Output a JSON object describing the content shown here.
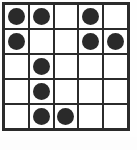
{
  "board": {
    "title": "5x5 dot grid",
    "rows": 5,
    "columns": 5,
    "cell_filled_label": "filled",
    "cell_empty_label": "empty",
    "colors": {
      "background": "#ffffff",
      "grid_line": "#2b2b2b",
      "cell": "#ffffff",
      "disc": "#2a2a2a"
    },
    "total_discs": 10,
    "cells": [
      [
        1,
        1,
        0,
        1,
        0
      ],
      [
        1,
        0,
        0,
        1,
        1
      ],
      [
        0,
        1,
        0,
        0,
        0
      ],
      [
        0,
        1,
        0,
        0,
        0
      ],
      [
        0,
        1,
        1,
        0,
        0
      ]
    ],
    "row_counts": [
      3,
      3,
      1,
      1,
      2
    ],
    "column_counts": [
      2,
      4,
      1,
      2,
      1
    ]
  }
}
